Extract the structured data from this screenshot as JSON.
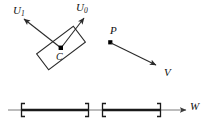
{
  "figure": {
    "labels": {
      "u1": {
        "base": "U",
        "sub": "1"
      },
      "u0": {
        "base": "U",
        "sub": "0"
      },
      "c": "C",
      "p": "P",
      "v": "V",
      "w": "W"
    },
    "colors": {
      "stroke": "#2a2a2a",
      "axis": "#6e6e6e",
      "interval": "#1a1a1a",
      "point": "#000000",
      "background": "#ffffff"
    },
    "box": {
      "name": "oriented-bounding-box",
      "center": {
        "x": 61,
        "y": 48
      },
      "rotation_deg": -37,
      "width": 46,
      "height": 20
    },
    "vectors": [
      {
        "name": "u1-axis-vector",
        "from": {
          "x": 61,
          "y": 48
        },
        "to": {
          "x": 22,
          "y": 17
        }
      },
      {
        "name": "u0-axis-vector",
        "from": {
          "x": 61,
          "y": 48
        },
        "to": {
          "x": 86,
          "y": 16
        }
      },
      {
        "name": "v-velocity-vector",
        "from": {
          "x": 110,
          "y": 42
        },
        "to": {
          "x": 158,
          "y": 66
        }
      }
    ],
    "points": [
      {
        "name": "box-center-point",
        "x": 61,
        "y": 48
      },
      {
        "name": "point-p",
        "x": 110,
        "y": 42
      }
    ],
    "axis": {
      "name": "w-projection-axis",
      "y": 110,
      "x_start": 8,
      "x_end": 188,
      "arrow": true
    },
    "intervals": [
      {
        "name": "projection-interval-1",
        "start": 22,
        "end": 88
      },
      {
        "name": "projection-interval-2",
        "start": 103,
        "end": 160
      }
    ]
  }
}
